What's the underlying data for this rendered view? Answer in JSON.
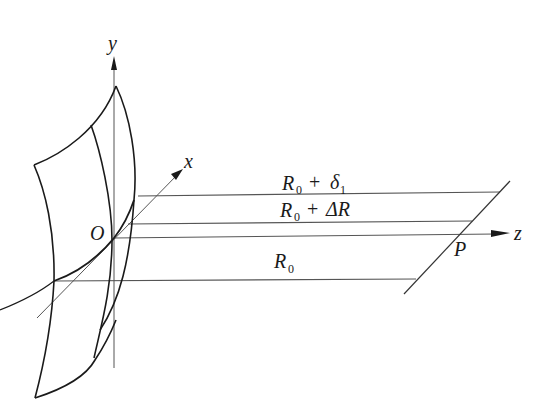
{
  "diagram": {
    "axes": {
      "y_label": "y",
      "x_label": "x",
      "z_label": "z",
      "origin_label": "O"
    },
    "point_label": "P",
    "lines": [
      {
        "name": "R0-plus-delta1",
        "prefix": "R",
        "sub": "0",
        "op": " + ",
        "term": "δ",
        "term_sub": "1"
      },
      {
        "name": "R0-plus-deltaR",
        "prefix": "R",
        "sub": "0",
        "op": " + ",
        "term": "ΔR",
        "term_sub": ""
      },
      {
        "name": "R0",
        "prefix": "R",
        "sub": "0",
        "op": "",
        "term": "",
        "term_sub": ""
      }
    ],
    "colors": {
      "stroke": "#1a1a1a",
      "thin_stroke": "#555555",
      "background": "#ffffff"
    }
  }
}
